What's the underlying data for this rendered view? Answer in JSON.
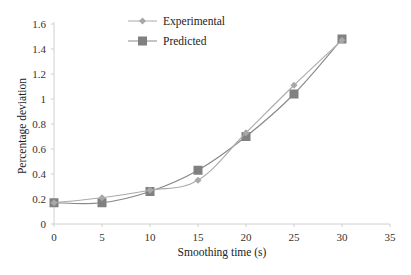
{
  "chart_data": {
    "type": "line",
    "title": "",
    "xlabel": "Smoothing time (s)",
    "ylabel": "Percentage deviation",
    "xlim": [
      0,
      35
    ],
    "ylim": [
      0,
      1.6
    ],
    "x_ticks": [
      0,
      5,
      10,
      15,
      20,
      25,
      30,
      35
    ],
    "y_ticks": [
      0,
      0.2,
      0.4,
      0.6,
      0.8,
      1,
      1.2,
      1.4,
      1.6
    ],
    "grid": false,
    "legend_position": "top-center",
    "x": [
      0,
      5,
      10,
      15,
      20,
      25,
      30
    ],
    "series": [
      {
        "name": "Experimental",
        "marker": "diamond",
        "color": "#aaaaaa",
        "values": [
          0.17,
          0.21,
          0.27,
          0.35,
          0.73,
          1.11,
          1.47
        ]
      },
      {
        "name": "Predicted",
        "marker": "square",
        "color": "#888888",
        "values": [
          0.17,
          0.17,
          0.26,
          0.43,
          0.7,
          1.04,
          1.48
        ]
      }
    ]
  },
  "legend": {
    "items": [
      {
        "label": "Experimental"
      },
      {
        "label": "Predicted"
      }
    ]
  },
  "axes": {
    "x_title": "Smoothing time (s)",
    "y_title": "Percentage deviation"
  }
}
